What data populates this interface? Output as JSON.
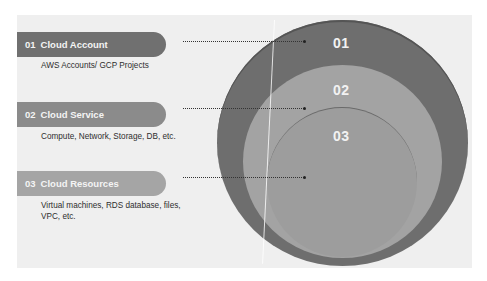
{
  "diagram": {
    "colors": {
      "panel_bg": "#efefef",
      "layer_01": "#6e6e6e",
      "layer_02": "#a3a3a3",
      "layer_03": "#9d9d9d",
      "pill_01": "#707070",
      "pill_02": "#8b8b8b",
      "pill_03": "#a5a5a5",
      "connector": "#333333"
    },
    "layers": [
      {
        "number": "01",
        "label": "Cloud Account",
        "description": "AWS Accounts/ GCP Projects",
        "circle_label": "01"
      },
      {
        "number": "02",
        "label": "Cloud Service",
        "description": "Compute, Network, Storage, DB, etc.",
        "circle_label": "02"
      },
      {
        "number": "03",
        "label": "Cloud Resources",
        "description": "Virtual machines, RDS database, files, VPC, etc.",
        "circle_label": "03"
      }
    ]
  }
}
